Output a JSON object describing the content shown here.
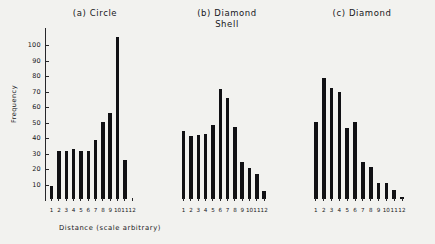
{
  "figure": {
    "xlabel": "Distance (scale arbitrary)",
    "ylabel": "Frequency",
    "bar_color": "#111114",
    "axis_color": "#27272a",
    "background": "#f2f2ef"
  },
  "chart_data": {
    "type": "bar",
    "title": "",
    "xlabel": "Distance (scale arbitrary)",
    "ylabel": "Frequency",
    "categories": [
      "1",
      "2",
      "3",
      "4",
      "5",
      "6",
      "7",
      "8",
      "9",
      "10",
      "11",
      "12"
    ],
    "ylim": [
      0,
      110
    ],
    "yticks": [
      10,
      20,
      30,
      40,
      50,
      60,
      70,
      80,
      90,
      100
    ],
    "grid": false,
    "legend": "none",
    "panels": [
      {
        "key": "a",
        "label": "(a) Circle",
        "title_lines": "(a) Circle",
        "values": [
          8,
          31,
          31,
          32,
          31,
          31,
          38,
          49.5,
          55.5,
          105,
          25,
          0
        ]
      },
      {
        "key": "b",
        "label": "(b) Diamond Shell",
        "title_lines": "(b) Diamond\nShell",
        "values": [
          44,
          40.5,
          41.5,
          42,
          48,
          71,
          65,
          46.5,
          24,
          20,
          16,
          5
        ]
      },
      {
        "key": "c",
        "label": "(c) Diamond",
        "title_lines": "(c) Diamond",
        "values": [
          50,
          78,
          72,
          69,
          46,
          50,
          24,
          20.5,
          10.5,
          10.5,
          6,
          1.5
        ]
      }
    ]
  }
}
